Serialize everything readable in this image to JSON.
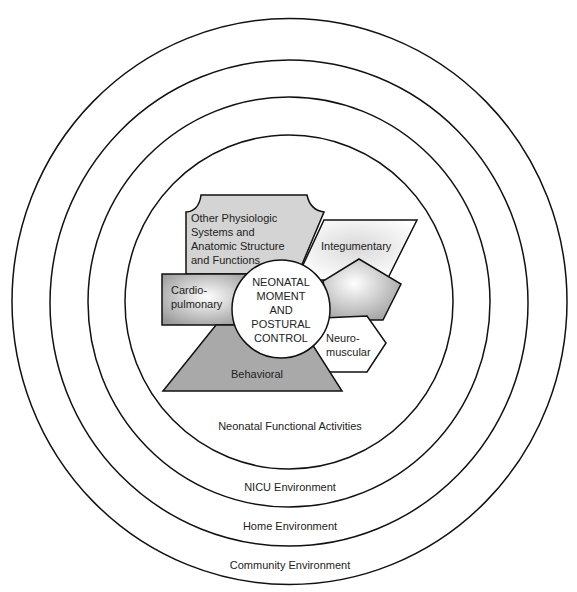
{
  "diagram": {
    "rings": [
      {
        "id": "community",
        "label": "Community Environment",
        "cx": 289.5,
        "cy": 301.5,
        "rx": 277.5,
        "ry": 283,
        "label_x": 290,
        "label_y": 569
      },
      {
        "id": "home",
        "label": "Home Environment",
        "cx": 289,
        "cy": 303,
        "rx": 239,
        "ry": 243,
        "label_x": 290,
        "label_y": 530
      },
      {
        "id": "nicu",
        "label": "NICU Environment",
        "cx": 289,
        "cy": 302,
        "rx": 201,
        "ry": 205,
        "label_x": 290,
        "label_y": 491
      },
      {
        "id": "functional",
        "label": "Neonatal Functional Activities",
        "cx": 289,
        "cy": 302,
        "rx": 164,
        "ry": 167,
        "label_x": 290,
        "label_y": 430
      }
    ],
    "center": {
      "lines": [
        "NEONATAL",
        "MOMENT",
        "AND",
        "POSTURAL",
        "CONTROL"
      ],
      "cx": 281,
      "cy": 309,
      "r": 49
    },
    "systems": {
      "other": {
        "lines": [
          "Other Physiologic",
          "Systems and",
          "Anatomic Structure",
          "and Functions"
        ],
        "fill": "#d4d4d4"
      },
      "integumentary": {
        "label": "Integumentary",
        "fill": "#eeeeee"
      },
      "pentagon": {
        "label": "",
        "fill": "#e2e2e2"
      },
      "cardiopulmonary": {
        "lines": [
          "Cardio-",
          "pulmonary"
        ],
        "fill": "#bdbdbd"
      },
      "neuromuscular": {
        "lines": [
          "Neuro-",
          "muscular"
        ],
        "fill": "#ffffff"
      },
      "behavioral": {
        "label": "Behavioral",
        "fill": "#a9a9a9"
      }
    }
  }
}
